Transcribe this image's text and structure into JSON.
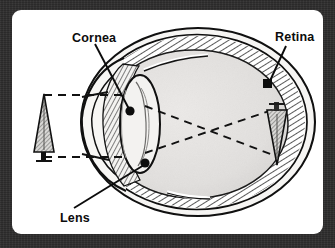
{
  "figure": {
    "title_visible": false,
    "labels": {
      "cornea": "Cornea",
      "lens": "Lens",
      "retina": "Retina"
    },
    "parts": [
      {
        "key": "cornea",
        "label": "Cornea",
        "label_x": 63,
        "label_y": 42,
        "dot_x": 118,
        "dot_y": 101
      },
      {
        "key": "lens",
        "label": "Lens",
        "label_x": 51,
        "label_y": 211,
        "dot_x": 133,
        "dot_y": 153
      },
      {
        "key": "retina",
        "label": "Retina",
        "label_x": 266,
        "label_y": 40,
        "dot_x": 256,
        "dot_y": 74
      }
    ],
    "object_arrow": {
      "direction": "up",
      "description": "upright object at left"
    },
    "image_arrow": {
      "direction": "down",
      "description": "inverted image on retina"
    },
    "light_rays": {
      "style": "dashed",
      "count": 2,
      "crossing": true,
      "description": "two dashed rays from object tip and base cross inside the eye"
    },
    "colors": {
      "frame": "#2e2d2d",
      "card": "#ffffff",
      "ink": "#0c0c0c",
      "vitreous_fill": "#e2e1df",
      "sclera_fill": "#f2f1ef",
      "hatch": "#3a3a3a",
      "dot": "#111111"
    }
  }
}
